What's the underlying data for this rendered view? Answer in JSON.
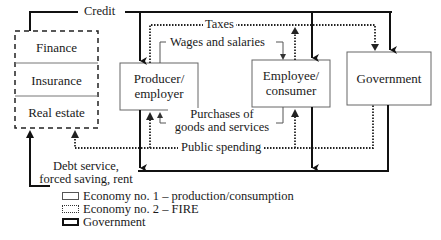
{
  "fire_box": {
    "sections": [
      "Finance",
      "Insurance",
      "Real estate"
    ]
  },
  "nodes": {
    "producer": "Producer/ employer",
    "producer_line1": "Producer/",
    "producer_line2": "employer",
    "employee_line1": "Employee/",
    "employee_line2": "consumer",
    "government": "Government"
  },
  "flows": {
    "credit": "Credit",
    "taxes": "Taxes",
    "wages": "Wages and salaries",
    "purchases_line1": "Purchases of",
    "purchases_line2": "goods and services",
    "public_spending": "Public spending",
    "debt_line1": "Debt service,",
    "debt_line2": "forced saving, rent"
  },
  "legend": [
    {
      "style": "thin-solid",
      "label": "Economy no. 1 – production/consumption"
    },
    {
      "style": "dotted",
      "label": "Economy no. 2 – FIRE"
    },
    {
      "style": "thick-solid",
      "label": "Government"
    }
  ],
  "colors": {
    "line": "#1a1a1a",
    "thin": "#555555",
    "background": "#ffffff"
  }
}
